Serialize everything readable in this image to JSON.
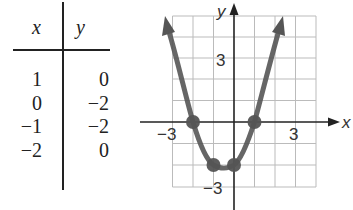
{
  "table": {
    "headers": [
      "x",
      "y"
    ],
    "rows": [
      {
        "x": "1",
        "y": "0"
      },
      {
        "x": "0",
        "y": "−2"
      },
      {
        "x": "−1",
        "y": "−2"
      },
      {
        "x": "−2",
        "y": "0"
      }
    ]
  },
  "graph": {
    "x_axis_label": "x",
    "y_axis_label": "y",
    "tick_labels": {
      "x_neg": "−3",
      "x_pos": "3",
      "y_pos": "3",
      "y_neg": "−3"
    },
    "colors": {
      "curve": "#555555",
      "grid": "#bbbbbb",
      "axis": "#222222"
    },
    "points": [
      [
        -2,
        0
      ],
      [
        -1,
        -2
      ],
      [
        0,
        -2
      ],
      [
        1,
        0
      ]
    ],
    "equation_shape": "parabola y = x^2 + x - 2",
    "grid_range": {
      "x": [
        -3,
        4
      ],
      "y": [
        -3,
        5
      ]
    }
  }
}
